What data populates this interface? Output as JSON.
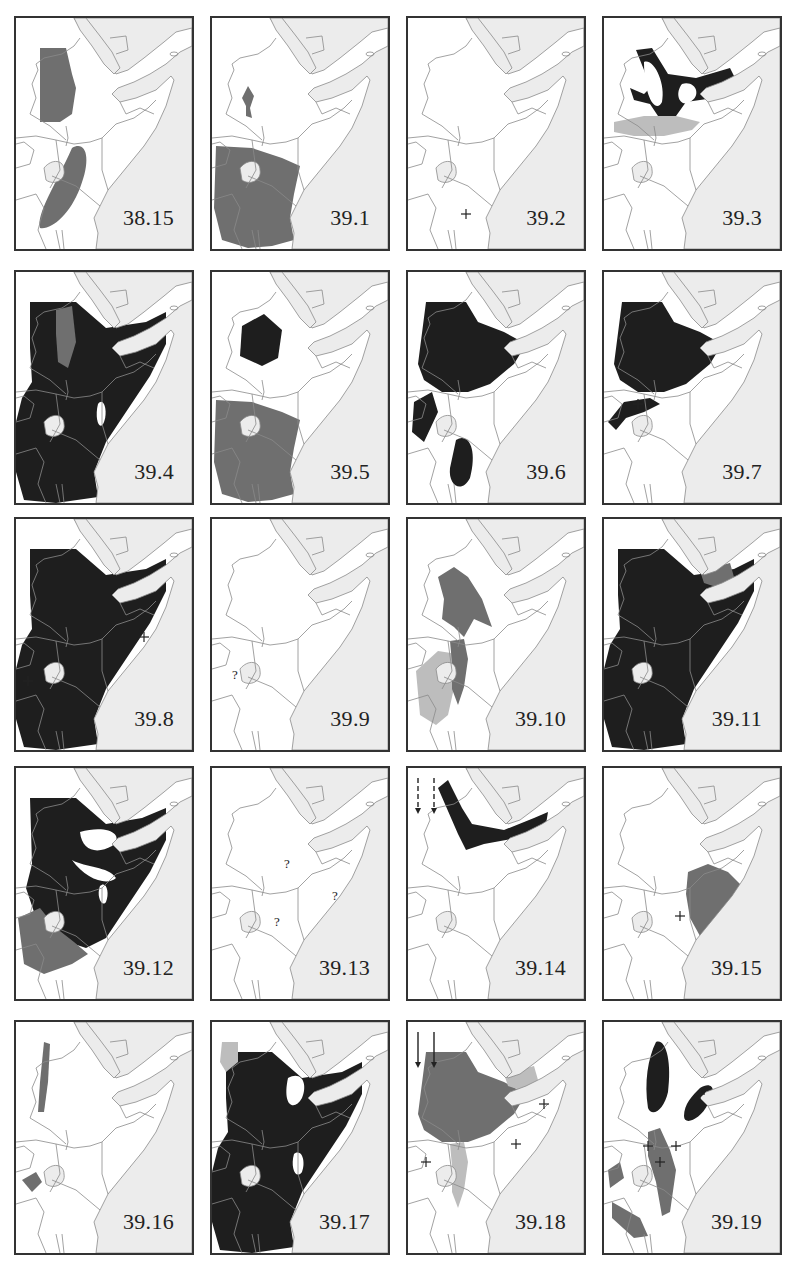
{
  "figure": {
    "type": "distribution-map-grid",
    "region": "East Africa / Horn of Africa",
    "rows": 5,
    "cols": 4,
    "colors": {
      "sea": "#ececec",
      "land": "#ffffff",
      "border": "#8a8a8a",
      "dark_range": "#1e1e1e",
      "mid_range": "#6f6f6f",
      "light_range": "#bdbdbd",
      "frame": "#333333"
    }
  },
  "maps": [
    {
      "id": "38.15",
      "label": "38.15",
      "fills": [
        {
          "shape": "eth-strip",
          "tone": "mid"
        },
        {
          "shape": "sw-blob",
          "tone": "mid"
        }
      ],
      "markers": []
    },
    {
      "id": "39.1",
      "label": "39.1",
      "fills": [
        {
          "shape": "small-eth",
          "tone": "mid"
        },
        {
          "shape": "tanzania",
          "tone": "mid"
        }
      ],
      "markers": []
    },
    {
      "id": "39.2",
      "label": "39.2",
      "fills": [],
      "markers": [
        {
          "type": "plus",
          "x": 58,
          "y": 196
        }
      ]
    },
    {
      "id": "39.3",
      "label": "39.3",
      "fills": [
        {
          "shape": "horn-ring",
          "tone": "dark"
        },
        {
          "shape": "south-eth-band",
          "tone": "light"
        }
      ],
      "markers": []
    },
    {
      "id": "39.4",
      "label": "39.4",
      "fills": [
        {
          "shape": "all-east",
          "tone": "dark"
        },
        {
          "shape": "eth-inner",
          "tone": "mid"
        }
      ],
      "markers": []
    },
    {
      "id": "39.5",
      "label": "39.5",
      "fills": [
        {
          "shape": "eth-hex",
          "tone": "dark"
        },
        {
          "shape": "tanzania",
          "tone": "mid"
        }
      ],
      "markers": []
    },
    {
      "id": "39.6",
      "label": "39.6",
      "fills": [
        {
          "shape": "eth-full",
          "tone": "dark"
        },
        {
          "shape": "west-blobs",
          "tone": "dark"
        }
      ],
      "markers": []
    },
    {
      "id": "39.7",
      "label": "39.7",
      "fills": [
        {
          "shape": "eth-full",
          "tone": "dark"
        },
        {
          "shape": "west-ribbon",
          "tone": "dark"
        }
      ],
      "markers": [
        {
          "type": "plus",
          "x": 34,
          "y": 132
        }
      ]
    },
    {
      "id": "39.8",
      "label": "39.8",
      "fills": [
        {
          "shape": "all-east",
          "tone": "dark"
        }
      ],
      "markers": [
        {
          "type": "plus",
          "x": 128,
          "y": 118
        },
        {
          "type": "plus",
          "x": 12,
          "y": 162
        }
      ]
    },
    {
      "id": "39.9",
      "label": "39.9",
      "fills": [],
      "markers": [
        {
          "type": "question",
          "x": 20,
          "y": 160
        }
      ]
    },
    {
      "id": "39.10",
      "label": "39.10",
      "fills": [
        {
          "shape": "eth-bird",
          "tone": "mid"
        },
        {
          "shape": "sw-light",
          "tone": "light"
        },
        {
          "shape": "kenya-strip",
          "tone": "mid"
        }
      ],
      "markers": []
    },
    {
      "id": "39.11",
      "label": "39.11",
      "fills": [
        {
          "shape": "all-east",
          "tone": "dark"
        },
        {
          "shape": "ne-tip",
          "tone": "mid"
        }
      ],
      "markers": []
    },
    {
      "id": "39.12",
      "label": "39.12",
      "fills": [
        {
          "shape": "eth-somalia",
          "tone": "dark"
        },
        {
          "shape": "sw-mixed",
          "tone": "mid"
        }
      ],
      "markers": []
    },
    {
      "id": "39.13",
      "label": "39.13",
      "fills": [],
      "markers": [
        {
          "type": "question",
          "x": 72,
          "y": 100
        },
        {
          "type": "question",
          "x": 120,
          "y": 132
        },
        {
          "type": "question",
          "x": 62,
          "y": 158
        }
      ]
    },
    {
      "id": "39.14",
      "label": "39.14",
      "fills": [
        {
          "shape": "north-v",
          "tone": "dark"
        }
      ],
      "markers": [
        {
          "type": "arrow-dashed",
          "x": 10,
          "y": 10
        },
        {
          "type": "arrow-dashed",
          "x": 26,
          "y": 10
        }
      ]
    },
    {
      "id": "39.15",
      "label": "39.15",
      "fills": [
        {
          "shape": "s-somalia",
          "tone": "mid"
        }
      ],
      "markers": [
        {
          "type": "plus",
          "x": 76,
          "y": 148
        }
      ]
    },
    {
      "id": "39.16",
      "label": "39.16",
      "fills": [
        {
          "shape": "west-bar",
          "tone": "mid"
        },
        {
          "shape": "small-west",
          "tone": "mid"
        }
      ],
      "markers": []
    },
    {
      "id": "39.17",
      "label": "39.17",
      "fills": [
        {
          "shape": "all-east",
          "tone": "dark"
        },
        {
          "shape": "nw-corner",
          "tone": "light"
        }
      ],
      "markers": []
    },
    {
      "id": "39.18",
      "label": "39.18",
      "fills": [
        {
          "shape": "eth-full",
          "tone": "mid"
        },
        {
          "shape": "kenya-strip",
          "tone": "light"
        },
        {
          "shape": "ne-tip",
          "tone": "light"
        }
      ],
      "markers": [
        {
          "type": "plus",
          "x": 136,
          "y": 82
        },
        {
          "type": "plus",
          "x": 108,
          "y": 122
        },
        {
          "type": "plus",
          "x": 18,
          "y": 140
        },
        {
          "type": "arrow-solid",
          "x": 10,
          "y": 10
        },
        {
          "type": "arrow-solid",
          "x": 26,
          "y": 10
        }
      ]
    },
    {
      "id": "39.19",
      "label": "39.19",
      "fills": [
        {
          "shape": "two-dark-lobes",
          "tone": "dark"
        },
        {
          "shape": "rift-mid",
          "tone": "mid"
        }
      ],
      "markers": [
        {
          "type": "plus",
          "x": 96,
          "y": 72
        },
        {
          "type": "plus",
          "x": 44,
          "y": 124
        },
        {
          "type": "plus",
          "x": 72,
          "y": 124
        },
        {
          "type": "plus",
          "x": 56,
          "y": 140
        }
      ]
    }
  ]
}
